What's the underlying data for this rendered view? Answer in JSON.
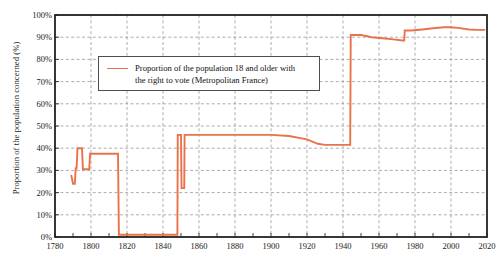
{
  "chart_data": {
    "type": "line",
    "title": "",
    "xlabel": "",
    "ylabel": "Proportion of the population concerned (%)",
    "xlim": [
      1780,
      2020
    ],
    "ylim": [
      0,
      100
    ],
    "grid": true,
    "legend_position": "upper-left-inside",
    "x_ticks": [
      1780,
      1800,
      1820,
      1840,
      1860,
      1880,
      1900,
      1920,
      1940,
      1960,
      1980,
      2000,
      2020
    ],
    "x_tick_labels": [
      "1780",
      "1800",
      "1820",
      "1840",
      "1860",
      "1880",
      "1900",
      "1920",
      "1940",
      "1960",
      "1980",
      "2000",
      "2020"
    ],
    "y_ticks": [
      0,
      10,
      20,
      30,
      40,
      50,
      60,
      70,
      80,
      90,
      100
    ],
    "y_tick_labels": [
      "0%",
      "10%",
      "20%",
      "30%",
      "40%",
      "50%",
      "60%",
      "70%",
      "80%",
      "90%",
      "100%"
    ],
    "line_color": "#E8734A",
    "series": [
      {
        "name": "Proportion of the population 18 and older with the right to vote (Metropolitan France)",
        "points": [
          [
            1789,
            28.0
          ],
          [
            1790,
            24.0
          ],
          [
            1791,
            24.0
          ],
          [
            1791.5,
            31.0
          ],
          [
            1792,
            31.0
          ],
          [
            1792.5,
            40.0
          ],
          [
            1794,
            40.0
          ],
          [
            1795,
            40.0
          ],
          [
            1795.5,
            30.5
          ],
          [
            1797,
            30.5
          ],
          [
            1799,
            30.5
          ],
          [
            1799.5,
            37.5
          ],
          [
            1801,
            37.5
          ],
          [
            1814,
            37.5
          ],
          [
            1815,
            37.5
          ],
          [
            1815.5,
            1.0
          ],
          [
            1820,
            1.0
          ],
          [
            1830,
            1.0
          ],
          [
            1840,
            1.0
          ],
          [
            1847,
            1.0
          ],
          [
            1848,
            1.0
          ],
          [
            1848.2,
            46.0
          ],
          [
            1849,
            46.0
          ],
          [
            1850,
            46.0
          ],
          [
            1850.3,
            22.0
          ],
          [
            1851,
            22.0
          ],
          [
            1851.8,
            22.0
          ],
          [
            1852,
            46.0
          ],
          [
            1860,
            46.0
          ],
          [
            1870,
            46.0
          ],
          [
            1880,
            46.0
          ],
          [
            1890,
            46.0
          ],
          [
            1900,
            46.0
          ],
          [
            1910,
            45.5
          ],
          [
            1920,
            44.0
          ],
          [
            1926,
            42.0
          ],
          [
            1930,
            41.5
          ],
          [
            1936,
            41.5
          ],
          [
            1944,
            41.5
          ],
          [
            1944.3,
            91.0
          ],
          [
            1946,
            91.0
          ],
          [
            1950,
            91.0
          ],
          [
            1956,
            90.0
          ],
          [
            1962,
            89.5
          ],
          [
            1968,
            89.0
          ],
          [
            1973,
            88.5
          ],
          [
            1974,
            88.5
          ],
          [
            1974.3,
            93.0
          ],
          [
            1978,
            93.0
          ],
          [
            1984,
            93.5
          ],
          [
            1990,
            94.0
          ],
          [
            1996,
            94.5
          ],
          [
            2000,
            94.5
          ],
          [
            2004,
            94.2
          ],
          [
            2010,
            93.5
          ],
          [
            2014,
            93.3
          ],
          [
            2019,
            93.3
          ]
        ]
      }
    ]
  },
  "legend": {
    "line1": "Proportion of the population 18 and older with",
    "line2": "the right to vote (Metropolitan France)"
  }
}
